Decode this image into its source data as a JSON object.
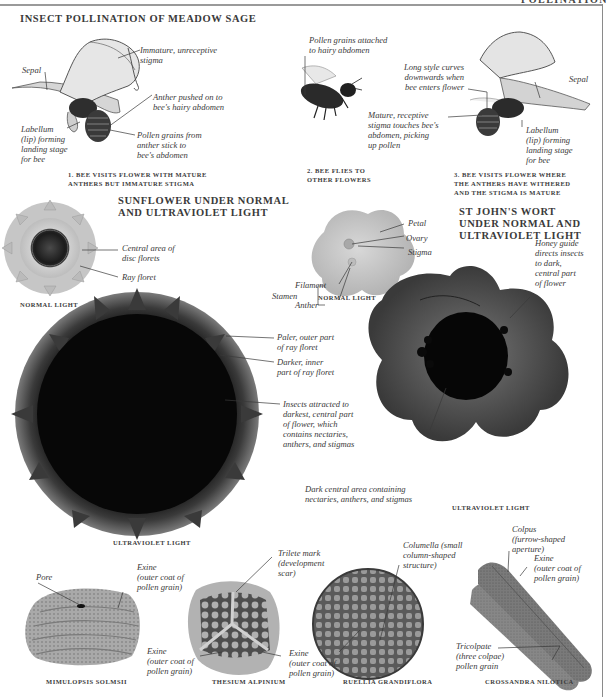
{
  "page": {
    "running_head": "POLLINATION"
  },
  "sage": {
    "title": "INSECT POLLINATION OF MEADOW SAGE",
    "step1": {
      "caption": [
        "1. BEE VISITS FLOWER WITH MATURE",
        "ANTHERS BUT IMMATURE STIGMA"
      ],
      "labels": {
        "sepal": "Sepal",
        "stigma": [
          "Immature, unreceptive",
          "stigma"
        ],
        "anther": [
          "Anther pushed on to",
          "bee's hairy abdomen"
        ],
        "labellum": [
          "Labellum",
          "(lip) forming",
          "landing stage",
          "for bee"
        ],
        "pollen": [
          "Pollen grains from",
          "anther stick to",
          "bee's abdomen"
        ]
      }
    },
    "step2": {
      "caption": [
        "2. BEE FLIES TO",
        "OTHER FLOWERS"
      ],
      "labels": {
        "pollen": [
          "Pollen grains attached",
          "to hairy abdomen"
        ]
      }
    },
    "step3": {
      "caption": [
        "3. BEE VISITS FLOWER WHERE",
        "THE ANTHERS HAVE WITHERED",
        "AND THE STIGMA IS MATURE"
      ],
      "labels": {
        "style": [
          "Long style curves",
          "downwards when",
          "bee enters flower"
        ],
        "sepal": "Sepal",
        "stigma": [
          "Mature, receptive",
          "stigma touches bee's",
          "abdomen, picking",
          "up pollen"
        ],
        "labellum": [
          "Labellum",
          "(lip) forming",
          "landing stage",
          "for bee"
        ]
      }
    }
  },
  "sunflower": {
    "title": [
      "SUNFLOWER UNDER NORMAL",
      "AND ULTRAVIOLET LIGHT"
    ],
    "normal": {
      "caption": "NORMAL LIGHT",
      "labels": {
        "disc": [
          "Central area of",
          "disc florets"
        ],
        "ray": "Ray floret"
      }
    },
    "uv": {
      "caption": "ULTRAVIOLET LIGHT",
      "labels": {
        "paler": [
          "Paler, outer part",
          "of  ray floret"
        ],
        "darker": [
          "Darker, inner",
          "part of  ray floret"
        ],
        "insects": [
          "Insects attracted to",
          "darkest, central part",
          "of flower, which",
          "contains nectaries,",
          "anthers, and stigmas"
        ]
      }
    }
  },
  "stjohns": {
    "title": [
      "ST JOHN'S WORT",
      "UNDER NORMAL AND",
      "ULTRAVIOLET LIGHT"
    ],
    "normal": {
      "caption": "NORMAL LIGHT",
      "labels": {
        "stamen": "Stamen",
        "filament": "Filament",
        "anther": "Anther",
        "petal": "Petal",
        "ovary": "Ovary",
        "stigma": "Stigma"
      }
    },
    "uv": {
      "caption": "ULTRAVIOLET LIGHT",
      "labels": {
        "honey": [
          "Honey guide",
          "directs insects",
          "to dark,",
          "central part",
          "of  flower"
        ],
        "dark": [
          "Dark central area containing",
          "nectaries, anthers, and stigmas"
        ]
      }
    }
  },
  "pollen": [
    {
      "caption": "MIMULOPSIS SOLMSII",
      "labels": {
        "pore": "Pore",
        "exine": [
          "Exine",
          "(outer coat of",
          "pollen grain)"
        ]
      }
    },
    {
      "caption": "THESIUM ALPINIUM",
      "labels": {
        "trilete": [
          "Trilete mark",
          "(development",
          "scar)"
        ],
        "exine": [
          "Exine",
          "(outer coat of",
          "pollen grain)"
        ]
      }
    },
    {
      "caption": "RUELLIA GRANDIFLORA",
      "labels": {
        "columella": [
          "Columella (small",
          "column-shaped",
          "structure)"
        ],
        "exine": [
          "Exine",
          "(outer coat of",
          "pollen grain)"
        ]
      }
    },
    {
      "caption": "CROSSANDRA NILOTICA",
      "labels": {
        "colpus": [
          "Colpus",
          "(furrow-shaped",
          "aperture)"
        ],
        "exine": [
          "Exine",
          "(outer coat of",
          "pollen grain)"
        ],
        "tricolpate": [
          "Tricolpate",
          "(three colpae)",
          "pollen grain"
        ]
      }
    }
  ]
}
